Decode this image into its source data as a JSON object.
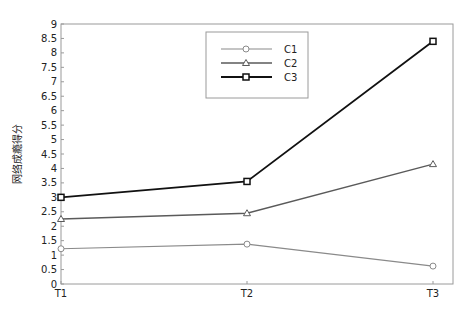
{
  "chart_data": {
    "type": "line",
    "title": "",
    "xlabel": "",
    "ylabel": "网络成瘾得分",
    "categories": [
      "T1",
      "T2",
      "T3"
    ],
    "ylim": [
      0,
      9
    ],
    "yticks": [
      0,
      0.5,
      1,
      1.5,
      2,
      2.5,
      3,
      3.5,
      4,
      4.5,
      5,
      5.5,
      6,
      6.5,
      7,
      7.5,
      8,
      8.5,
      9
    ],
    "ytick_labels": [
      "0",
      "0.5",
      "1",
      "1.5",
      "2",
      "2.5",
      "3",
      "3.5",
      "4",
      "4.5",
      "5",
      "5.5",
      "6",
      "6.5",
      "7",
      "7.5",
      "8",
      "8.5",
      "9"
    ],
    "grid": false,
    "legend_position": "upper center",
    "series": [
      {
        "name": "C1",
        "values": [
          1.22,
          1.38,
          0.62
        ],
        "color": "#8a8a8a",
        "marker": "circle",
        "width": 1.2
      },
      {
        "name": "C2",
        "values": [
          2.25,
          2.45,
          4.15
        ],
        "color": "#5a5a5a",
        "marker": "triangle",
        "width": 1.4
      },
      {
        "name": "C3",
        "values": [
          3.0,
          3.55,
          8.4
        ],
        "color": "#111111",
        "marker": "square",
        "width": 1.8
      }
    ]
  }
}
